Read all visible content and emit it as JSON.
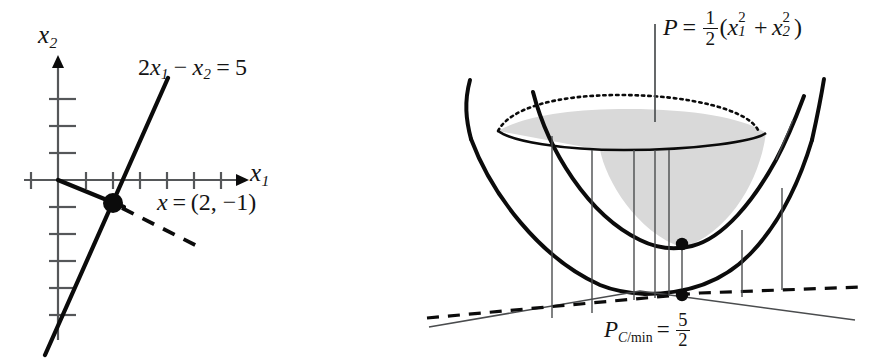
{
  "figure": {
    "background_color": "#ffffff",
    "ink_color": "#0b0b0b",
    "shade_color": "#d9d9d9"
  },
  "left_panel": {
    "name": "constraint-line-plot",
    "axes": {
      "x_label": "x",
      "x_label_sub": "1",
      "y_label": "x",
      "y_label_sub": "2",
      "origin_px": [
        58,
        180
      ],
      "tick_spacing_px": 27,
      "x_ticks": [
        -1,
        1,
        2,
        3,
        4,
        5,
        6
      ],
      "y_ticks": [
        -5,
        -4,
        -3,
        -2,
        -1,
        1,
        2,
        3
      ]
    },
    "constraint_label": {
      "coefficient": "2",
      "var1": "x",
      "var1_sub": "1",
      "minus": "−",
      "var2": "x",
      "var2_sub": "2",
      "equals": "=",
      "rhs": "5",
      "text": "2x₁ − x₂ = 5"
    },
    "solution_label": {
      "var": "x",
      "equals": "=",
      "value": "(2, −1)",
      "text": "x = (2, −1)"
    },
    "solution_point": {
      "x": 2,
      "y": -1,
      "px": [
        113,
        203
      ]
    },
    "series": [
      {
        "name": "constraint-line",
        "style": "solid-heavy",
        "equation": "2x1 - x2 = 5"
      },
      {
        "name": "gradient-ray",
        "style": "solid-heavy",
        "from_origin": true
      },
      {
        "name": "level-set-dashed",
        "style": "dashed-heavy"
      }
    ]
  },
  "right_panel": {
    "name": "paraboloid-plot",
    "objective_label": {
      "P": "P",
      "equals": "=",
      "half_num": "1",
      "half_den": "2",
      "open": "(",
      "x1": "x",
      "x1_sub": "1",
      "x1_sup": "2",
      "plus": "+",
      "x2": "x",
      "x2_sub": "2",
      "x2_sup": "2",
      "close": ")",
      "text": "P = 1/2 (x₁² + x₂²)"
    },
    "minimum_label": {
      "P": "P",
      "sub_C": "C",
      "sub_slash": "/",
      "sub_min": "min",
      "equals": "=",
      "num": "5",
      "den": "2",
      "text": "P_{C/min} = 5/2"
    },
    "elements": [
      {
        "name": "bowl-rim-back",
        "style": "dotted"
      },
      {
        "name": "bowl-rim-front",
        "style": "solid"
      },
      {
        "name": "bowl-interior-shading",
        "color": "#d9d9d9"
      },
      {
        "name": "outer-paraboloid-left-wall",
        "style": "solid-thick"
      },
      {
        "name": "outer-paraboloid-right-wall",
        "style": "solid-thick"
      },
      {
        "name": "constrained-section-parabola",
        "style": "solid-thick"
      },
      {
        "name": "ground-plane-line",
        "style": "thin-solid"
      },
      {
        "name": "constraint-line-ground",
        "style": "dashed-heavy"
      },
      {
        "name": "projection-lines",
        "count": 8,
        "style": "thin-vertical"
      },
      {
        "name": "minimum-point-on-surface",
        "px": [
          682,
          244
        ]
      },
      {
        "name": "minimum-point-on-ground",
        "px": [
          682,
          295
        ]
      },
      {
        "name": "objective-leader-stem",
        "style": "thin-vertical"
      }
    ]
  }
}
